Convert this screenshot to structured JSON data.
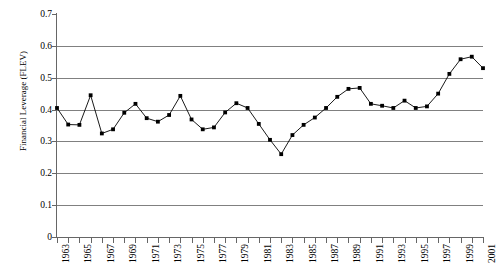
{
  "chart_data": {
    "type": "line",
    "title": "",
    "subtitle": "",
    "xlabel": "",
    "ylabel": "Financial Leverage (FLEV)",
    "x": [
      1963,
      1964,
      1965,
      1966,
      1967,
      1968,
      1969,
      1970,
      1971,
      1972,
      1973,
      1974,
      1975,
      1976,
      1977,
      1978,
      1979,
      1980,
      1981,
      1982,
      1983,
      1984,
      1985,
      1986,
      1987,
      1988,
      1989,
      1990,
      1991,
      1992,
      1993,
      1994,
      1995,
      1996,
      1997,
      1998,
      1999,
      2000,
      2001
    ],
    "values": [
      0.405,
      0.353,
      0.352,
      0.445,
      0.325,
      0.338,
      0.39,
      0.418,
      0.373,
      0.362,
      0.383,
      0.443,
      0.369,
      0.338,
      0.344,
      0.391,
      0.42,
      0.405,
      0.355,
      0.305,
      0.26,
      0.32,
      0.352,
      0.375,
      0.405,
      0.44,
      0.465,
      0.468,
      0.418,
      0.412,
      0.405,
      0.428,
      0.405,
      0.41,
      0.45,
      0.512,
      0.558,
      0.566,
      0.53
    ],
    "xticklabels": [
      "1963",
      "1965",
      "1967",
      "1969",
      "1971",
      "1973",
      "1975",
      "1977",
      "1979",
      "1981",
      "1983",
      "1985",
      "1987",
      "1989",
      "1991",
      "1993",
      "1995",
      "1997",
      "1999",
      "2001"
    ],
    "yticklabels": [
      "0.7",
      "0.6",
      "0.5",
      "0.4",
      "0.3",
      "0.2",
      "0.1",
      "0"
    ],
    "yticks": [
      0.7,
      0.6,
      0.5,
      0.4,
      0.3,
      0.2,
      0.1,
      0
    ],
    "ylim": [
      0,
      0.7
    ],
    "xlim": [
      1963,
      2001
    ],
    "grid": "horizontal",
    "legend": "none",
    "marker": "square",
    "line_color": "#000000",
    "marker_color": "#000000",
    "grid_color": "#808080",
    "axis_color": "#666666",
    "background": "#ffffff"
  }
}
